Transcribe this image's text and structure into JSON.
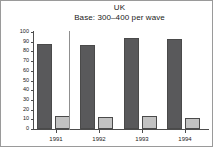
{
  "chart_data": {
    "type": "bar",
    "title": "UK",
    "subtitle": "Base: 300–400 per wave",
    "xlabel": "",
    "ylabel": "",
    "categories": [
      "1991",
      "1992",
      "1993",
      "1994"
    ],
    "series": [
      {
        "name": "dark",
        "color": "#59595b",
        "values": [
          88,
          87,
          94,
          93
        ]
      },
      {
        "name": "light",
        "color": "#c2c2c2",
        "values": [
          13,
          12,
          13,
          11
        ]
      }
    ],
    "ylim": [
      0,
      100
    ],
    "ytick_labels": [
      "100",
      "90",
      "80",
      "70",
      "60",
      "50",
      "40",
      "30",
      "20",
      "10",
      "0"
    ],
    "ytick_values": [
      100,
      90,
      80,
      70,
      60,
      50,
      40,
      30,
      20,
      10,
      0
    ],
    "grid": false,
    "legend": "none",
    "annotations": [
      {
        "name": "group-divider",
        "after_category": "1991"
      }
    ],
    "frame_color": "#9a9a9a",
    "axis_color": "#4d4d4d"
  }
}
